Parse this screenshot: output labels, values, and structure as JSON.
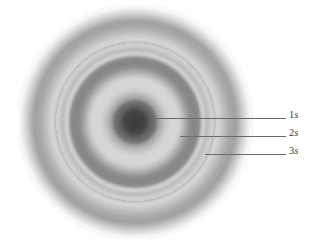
{
  "figure": {
    "type": "orbital-probability-density-diagram",
    "background_color": "#ffffff",
    "caption": "",
    "cloud": {
      "center_x": 135,
      "center_y": 122,
      "outer_radius": 117,
      "description": "stippled grayscale electron probability density cloud with spherical nodal surfaces",
      "ink_color": "#2a2a2a"
    }
  },
  "annotations": [
    {
      "id": "1s",
      "n": "1",
      "s": "s",
      "label": "1s",
      "label_x": 289,
      "label_y": 109,
      "line_x": 150,
      "line_y": 118,
      "line_length": 136,
      "target_radius": 0,
      "meaning": "innermost dark core region"
    },
    {
      "id": "2s",
      "n": "2",
      "s": "s",
      "label": "2s",
      "label_x": 289,
      "label_y": 127,
      "line_x": 180,
      "line_y": 136,
      "line_length": 106,
      "target_radius": 52,
      "meaning": "second dark shell between first and second nodes"
    },
    {
      "id": "3s",
      "n": "3",
      "s": "s",
      "label": "3s",
      "label_x": 289,
      "label_y": 145,
      "line_x": 205,
      "line_y": 154,
      "line_length": 81,
      "target_radius": 90,
      "meaning": "outer dark shell beyond second node"
    }
  ],
  "radial_profile": {
    "description": "normalized ink density as a function of radius in pixels from cloud center",
    "radii": [
      0,
      6,
      12,
      18,
      24,
      30,
      34,
      38,
      42,
      46,
      52,
      58,
      63,
      68,
      72,
      78,
      85,
      92,
      100,
      107,
      113,
      117
    ],
    "density": [
      1.0,
      0.96,
      0.84,
      0.62,
      0.4,
      0.18,
      0.06,
      0.0,
      0.12,
      0.34,
      0.52,
      0.48,
      0.26,
      0.0,
      0.1,
      0.26,
      0.4,
      0.44,
      0.36,
      0.2,
      0.07,
      0.0
    ],
    "nodes": [
      38,
      68
    ],
    "shell_peaks": [
      0,
      52,
      90
    ]
  },
  "colors": {
    "background": "#ffffff",
    "ink": "#2a2a2a",
    "node_white": "#ffffff",
    "leader_line": "#6b6b6b",
    "label_text": "#3a3a3a"
  }
}
